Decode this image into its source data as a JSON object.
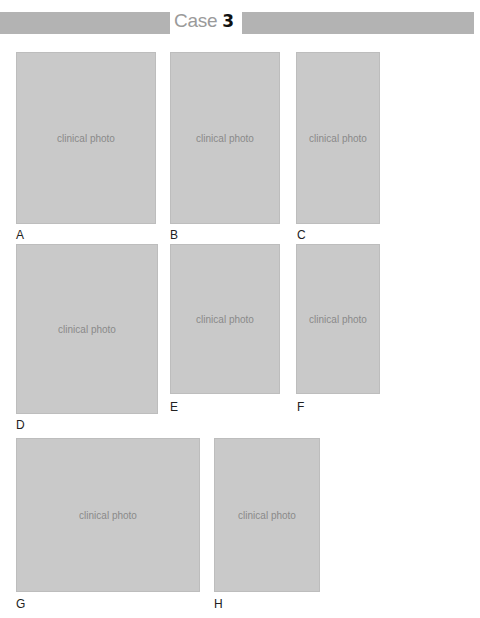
{
  "header": {
    "case_word": "Case",
    "case_number": "3"
  },
  "panels": [
    {
      "label": "A",
      "placeholder": "clinical photo"
    },
    {
      "label": "B",
      "placeholder": "clinical photo"
    },
    {
      "label": "C",
      "placeholder": "clinical photo"
    },
    {
      "label": "D",
      "placeholder": "clinical photo"
    },
    {
      "label": "E",
      "placeholder": "clinical photo"
    },
    {
      "label": "F",
      "placeholder": "clinical photo"
    },
    {
      "label": "G",
      "placeholder": "clinical photo"
    },
    {
      "label": "H",
      "placeholder": "clinical photo"
    }
  ]
}
